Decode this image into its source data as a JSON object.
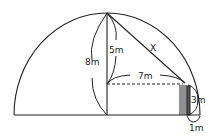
{
  "diagram": {
    "type": "geometry",
    "labels": {
      "total_height": "8m",
      "upper_segment": "5m",
      "horizontal_distance": "7m",
      "hypotenuse": "X",
      "pole_height": "3m",
      "gap_to_edge": "1m"
    },
    "colors": {
      "stroke": "#222222",
      "background": "#ffffff"
    }
  }
}
